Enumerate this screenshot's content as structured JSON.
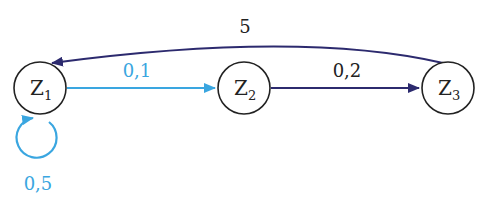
{
  "colors": {
    "light_edge": "#3aa6e0",
    "dark_edge": "#2c2a6e",
    "node_stroke": "#222222"
  },
  "nodes": [
    {
      "id": "Z1",
      "letter": "Z",
      "sub": "1"
    },
    {
      "id": "Z2",
      "letter": "Z",
      "sub": "2"
    },
    {
      "id": "Z3",
      "letter": "Z",
      "sub": "3"
    }
  ],
  "edges": [
    {
      "from": "Z1",
      "to": "Z2",
      "label": "0,1",
      "color": "light"
    },
    {
      "from": "Z2",
      "to": "Z3",
      "label": "0,2",
      "color": "dark"
    },
    {
      "from": "Z3",
      "to": "Z1",
      "label": "5",
      "color": "dark"
    },
    {
      "from": "Z1",
      "to": "Z1",
      "label": "0,5",
      "color": "light"
    }
  ]
}
